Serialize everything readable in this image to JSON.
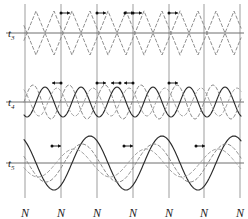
{
  "figure": {
    "width": 248,
    "height": 219,
    "background": "#ffffff"
  },
  "colors": {
    "gridline": "#b9b9b9",
    "axis": "#6e6e6e",
    "solid_wave": "#2b2b2b",
    "dashed_wave": "#8c8c8c",
    "dashed_wave_alt": "#a5a5a5",
    "marker": "#111111",
    "text": "#1a1a1a"
  },
  "axis": {
    "gridline_positions": [
      25,
      61,
      97,
      133,
      169,
      204,
      240
    ],
    "tick_label": "N",
    "tick_labels": [
      "N",
      "N",
      "N",
      "N",
      "N",
      "N",
      "N"
    ],
    "tick_label_y": 207,
    "period": 36
  },
  "panels": [
    {
      "id": "t3",
      "label": "t",
      "subscript": "3",
      "label_x": 8,
      "label_y": 28,
      "baseline_y": 33,
      "amplitude": 22,
      "waveform": "triangle",
      "marker_count": 5,
      "marker_y": 13
    },
    {
      "id": "t4",
      "label": "t",
      "subscript": "4",
      "label_x": 8,
      "label_y": 97,
      "baseline_y": 102,
      "amplitude": 17,
      "waveform": "sine",
      "marker_count": 5,
      "marker_y": 83
    },
    {
      "id": "t5",
      "label": "t",
      "subscript": "5",
      "label_x": 8,
      "label_y": 158,
      "baseline_y": 163,
      "amplitude": 27,
      "waveform": "sine-sharp",
      "marker_count": 3,
      "marker_y": 146
    }
  ],
  "chart_data": {
    "type": "line",
    "title": "",
    "xlabel": "",
    "ylabel": "",
    "grid": true,
    "legend": "none",
    "xlim": [
      25,
      240
    ],
    "x_tick_labels": [
      "N",
      "N",
      "N",
      "N",
      "N",
      "N",
      "N"
    ],
    "x_tick_values": [
      25,
      61,
      97,
      133,
      169,
      204,
      240
    ],
    "panels": [
      {
        "name": "t3",
        "ylim": [
          -22,
          22
        ],
        "series": [
          {
            "name": "wave-a",
            "style": "dashed",
            "color": "#8c8c8c",
            "waveform": "triangle",
            "amplitude": 22,
            "period": 36,
            "phase_deg": 0
          },
          {
            "name": "wave-b",
            "style": "dashed",
            "color": "#8c8c8c",
            "waveform": "triangle",
            "amplitude": 22,
            "period": 36,
            "phase_deg": 180
          }
        ],
        "markers": [
          {
            "x": 61,
            "y": 13,
            "arrow": "right"
          },
          {
            "x": 97,
            "y": 13,
            "arrow": "right"
          },
          {
            "x": 125,
            "y": 13,
            "arrow": "right"
          },
          {
            "x": 133,
            "y": 13,
            "arrow": "right"
          },
          {
            "x": 169,
            "y": 13,
            "arrow": "right"
          }
        ]
      },
      {
        "name": "t4",
        "ylim": [
          -17,
          17
        ],
        "series": [
          {
            "name": "wave-solid",
            "style": "solid",
            "color": "#2b2b2b",
            "waveform": "sine",
            "amplitude": 15,
            "period": 36,
            "phase_deg": 0
          },
          {
            "name": "wave-dash-1",
            "style": "dashed",
            "color": "#8c8c8c",
            "waveform": "sine",
            "amplitude": 17,
            "period": 36,
            "phase_deg": 120
          },
          {
            "name": "wave-dash-2",
            "style": "dashed",
            "color": "#a5a5a5",
            "waveform": "sine",
            "amplitude": 14,
            "period": 36,
            "phase_deg": 240
          }
        ],
        "markers": [
          {
            "x": 61,
            "y": 83,
            "arrow": "left"
          },
          {
            "x": 97,
            "y": 83,
            "arrow": "right"
          },
          {
            "x": 120,
            "y": 83,
            "arrow": "left"
          },
          {
            "x": 133,
            "y": 83,
            "arrow": "left"
          },
          {
            "x": 169,
            "y": 83,
            "arrow": "right"
          }
        ]
      },
      {
        "name": "t5",
        "ylim": [
          -27,
          27
        ],
        "series": [
          {
            "name": "wave-solid",
            "style": "solid",
            "color": "#2b2b2b",
            "waveform": "sine",
            "amplitude": 27,
            "period": 72,
            "phase_deg": 0
          },
          {
            "name": "wave-dash-1",
            "style": "dashed",
            "color": "#8c8c8c",
            "waveform": "sine",
            "amplitude": 19,
            "period": 72,
            "phase_deg": 40
          },
          {
            "name": "wave-dash-2",
            "style": "dashed",
            "color": "#a5a5a5",
            "waveform": "sine",
            "amplitude": 14,
            "period": 72,
            "phase_deg": 80
          }
        ],
        "markers": [
          {
            "x": 52,
            "y": 146,
            "arrow": "right"
          },
          {
            "x": 124,
            "y": 146,
            "arrow": "right"
          },
          {
            "x": 196,
            "y": 146,
            "arrow": "right"
          }
        ]
      }
    ]
  }
}
